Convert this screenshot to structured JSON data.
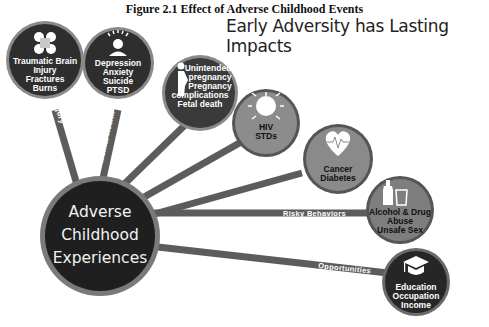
{
  "figure_title": "Figure 2.1 Effect of Adverse Childhood Events",
  "main_title": "Early Adversity has Lasting Impacts",
  "hub": {
    "lines": [
      "Adverse",
      "Childhood",
      "Experiences"
    ]
  },
  "spokes": [
    {
      "label": "Injury",
      "icon": "cross-bandage-icon",
      "outcomes": [
        "Traumatic Brain",
        "Injury",
        "Fractures",
        "Burns"
      ]
    },
    {
      "label": "Mental Health",
      "icon": "person-head-rays-icon",
      "outcomes": [
        "Depression",
        "Anxiety",
        "Suicide",
        "PTSD"
      ]
    },
    {
      "label": "Maternal Health",
      "icon": "pregnant-woman-icon",
      "outcomes": [
        "Unintended",
        "pregnancy",
        "Pregnancy",
        "complications",
        "Fetal death"
      ]
    },
    {
      "label": "Infectious Disease",
      "icon": "virus-icon",
      "outcomes": [
        "HIV",
        "STDs"
      ]
    },
    {
      "label": "Chronic Disease",
      "icon": "heart-pulse-icon",
      "outcomes": [
        "Cancer",
        "Diabetes"
      ]
    },
    {
      "label": "Risky Behaviors",
      "icon": "bottle-glass-icon",
      "outcomes": [
        "Alcohol & Drug",
        "Abuse",
        "Unsafe Sex"
      ]
    },
    {
      "label": "Opportunities",
      "icon": "graduation-cap-icon",
      "outcomes": [
        "Education",
        "Occupation",
        "Income"
      ]
    }
  ],
  "colors": {
    "dark_node": "#2b2b2b",
    "mid_node": "#5a5a5a",
    "light_node": "#8a8a8a",
    "spoke": "#5c5c5c",
    "hub_ring": "#7a7a7a"
  }
}
